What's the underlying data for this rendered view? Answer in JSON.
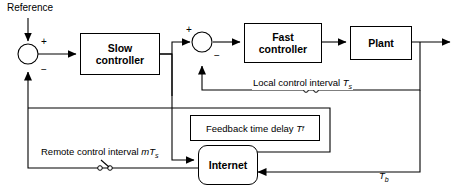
{
  "diagram": {
    "background": "#ffffff",
    "line_color": "#000000"
  },
  "signals": {
    "reference_label": "Reference"
  },
  "blocks": [
    {
      "id": "slow-controller",
      "label_line1": "Slow",
      "label_line2": "controller",
      "shape": "rect"
    },
    {
      "id": "fast-controller",
      "label_line1": "Fast",
      "label_line2": "controller",
      "shape": "rect"
    },
    {
      "id": "plant",
      "label_line1": "Plant",
      "label_line2": "",
      "shape": "rect"
    },
    {
      "id": "internet",
      "label_line1": "Internet",
      "label_line2": "",
      "shape": "rounded-rect"
    }
  ],
  "block_labels": {
    "slow_l1": "Slow",
    "slow_l2": "controller",
    "fast_l1": "Fast",
    "fast_l2": "controller",
    "plant": "Plant",
    "internet": "Internet"
  },
  "annotations": {
    "local_interval_text": "Local control interval",
    "local_interval_symbol": "T",
    "local_interval_subscript": "s",
    "feedback_delay_text": "Feedback time delay",
    "feedback_delay_symbol": "T",
    "feedback_delay_subscript": "f",
    "remote_interval_text": "Remote control interval",
    "remote_interval_symbol": "mT",
    "remote_interval_subscript": "s",
    "backward_delay_symbol": "T",
    "backward_delay_subscript": "b"
  },
  "summing_junctions": [
    {
      "id": "junction-1",
      "top_sign": "+",
      "bottom_sign": "−"
    },
    {
      "id": "junction-2",
      "left_sign": "+",
      "bottom_sign": "−"
    }
  ],
  "signs": {
    "j1_plus": "+",
    "j1_minus": "−",
    "j2_plus": "+",
    "j2_minus": "−"
  },
  "switches": [
    {
      "id": "switch-local-feedback",
      "state": "open"
    },
    {
      "id": "switch-remote-feedback",
      "state": "open"
    }
  ]
}
